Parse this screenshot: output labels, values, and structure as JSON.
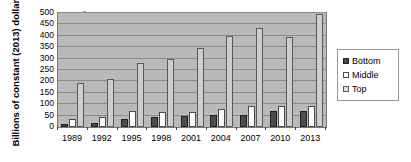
{
  "chart_data": {
    "type": "bar",
    "title": "",
    "subtitle": "",
    "xlabel": "",
    "ylabel": "Billions of constant (2013) dollars",
    "categories": [
      "1989",
      "1992",
      "1995",
      "1998",
      "2001",
      "2004",
      "2007",
      "2010",
      "2013"
    ],
    "series": [
      {
        "name": "Bottom",
        "values": [
          15,
          18,
          37,
          45,
          50,
          52,
          52,
          70,
          71
        ],
        "color": "#4c4c4c"
      },
      {
        "name": "Middle",
        "values": [
          37,
          43,
          72,
          67,
          68,
          80,
          90,
          92,
          90
        ],
        "color": "#ffffff"
      },
      {
        "name": "Top",
        "values": [
          193,
          212,
          281,
          300,
          345,
          401,
          433,
          394,
          494
        ],
        "color": "#e2e2e2"
      }
    ],
    "ylim": [
      0,
      500
    ],
    "yticks": [
      0,
      50,
      100,
      150,
      200,
      250,
      300,
      350,
      400,
      450,
      500
    ],
    "ytick_labels": [
      "0",
      "50",
      "100",
      "150",
      "200",
      "250",
      "300",
      "350",
      "400",
      "450",
      "500"
    ],
    "grid": true,
    "grid_axis": "y",
    "legend_position": "right",
    "plot_background": "#b9b9b9",
    "figure_background": "#ffffff"
  }
}
